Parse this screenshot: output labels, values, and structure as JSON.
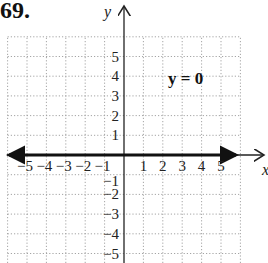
{
  "problem_number": "69.",
  "equation_label": "y = 0",
  "colors": {
    "grid": "#9a9a9a",
    "axis": "#222222",
    "line": "#111111"
  },
  "chart_data": {
    "type": "line",
    "title": "y = 0",
    "xlabel": "x",
    "ylabel": "y",
    "xlim": [
      -6,
      6
    ],
    "ylim": [
      -6,
      6
    ],
    "grid": true,
    "x_ticks": [
      "-5",
      "-4",
      "-3",
      "-2",
      "-1",
      "1",
      "2",
      "3",
      "4",
      "5"
    ],
    "y_ticks": [
      "5",
      "4",
      "3",
      "2",
      "1",
      "-1",
      "-2",
      "-3",
      "-4",
      "-5"
    ],
    "series": [
      {
        "name": "y = 0",
        "x": [
          -6,
          6
        ],
        "y": [
          0,
          0
        ],
        "style": "thick line with arrows at both ends"
      }
    ],
    "annotations": [
      {
        "text": "y = 0",
        "x": 3,
        "y": 4
      }
    ]
  }
}
